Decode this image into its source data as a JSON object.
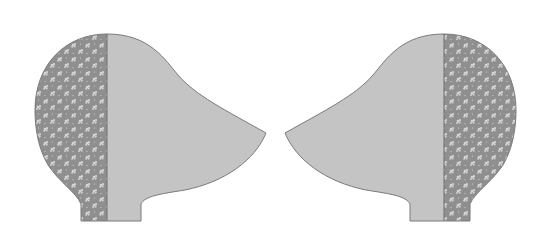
{
  "diagram": {
    "type": "sewing-pattern-pieces",
    "pieces": [
      {
        "id": "left-piece",
        "orientation": "facing-right",
        "parts": [
          "floral-back-strip",
          "plain-front-panel"
        ]
      },
      {
        "id": "right-piece",
        "orientation": "facing-left",
        "parts": [
          "plain-front-panel",
          "floral-back-strip"
        ]
      }
    ]
  },
  "colors": {
    "background": "#ffffff",
    "plain_fabric": "#c4c4c4",
    "floral_fabric_base": "#8f8f8f",
    "floral_flower": "#d6d6d6",
    "outline": "#7a7a7a",
    "seam": "#6e6e6e"
  }
}
